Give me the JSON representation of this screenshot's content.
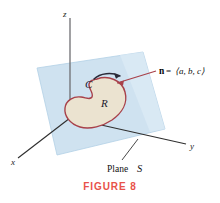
{
  "figure": {
    "caption": "FIGURE 8",
    "caption_color": "#e8524a",
    "background_color": "#ffffff"
  },
  "axes": {
    "x_label": "x",
    "y_label": "y",
    "z_label": "z",
    "axis_color": "#3a3a3a",
    "origin": {
      "x": 70,
      "y": 118
    }
  },
  "plane": {
    "label_text": "Plane",
    "label_symbol": "S",
    "fill_color": "#cfe2f0",
    "edge_color": "#aac9e0",
    "leader_color": "#333333"
  },
  "region": {
    "label": "R",
    "fill_color": "#ebe3d0",
    "outline_color": "#a8414a"
  },
  "curve": {
    "label": "C",
    "orientation_arrow_color": "#2a2a38"
  },
  "normal_vector": {
    "symbol": "n",
    "equals": "=",
    "components": "⟨a, b, c⟩",
    "leader_color": "#a8414a"
  }
}
